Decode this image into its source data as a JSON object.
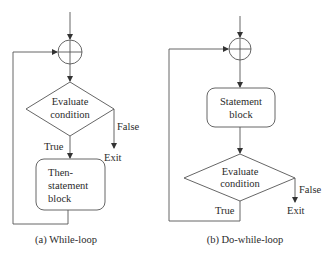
{
  "figure": {
    "while_loop": {
      "decision_label_line1": "Evaluate",
      "decision_label_line2": "condition",
      "true_label": "True",
      "false_label": "False",
      "exit_label": "Exit",
      "block_line1": "Then-",
      "block_line2": "statement",
      "block_line3": "block",
      "caption": "(a) While-loop"
    },
    "do_while_loop": {
      "block_line1": "Statement",
      "block_line2": "block",
      "decision_label_line1": "Evaluate",
      "decision_label_line2": "condition",
      "true_label": "True",
      "false_label": "False",
      "exit_label": "Exit",
      "caption": "(b) Do-while-loop"
    }
  },
  "colors": {
    "stroke": "#4a4a4a",
    "text": "#2b2b2b",
    "background": "#ffffff"
  }
}
